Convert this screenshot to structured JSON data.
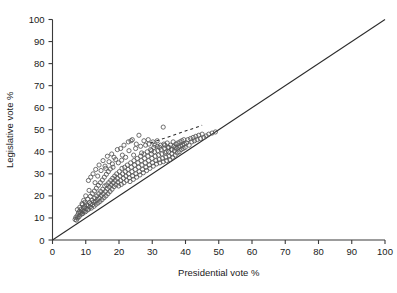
{
  "chart_data": {
    "type": "scatter",
    "title": "",
    "xlabel": "Presidential vote %",
    "ylabel": "Legislative vote %",
    "xlim": [
      0,
      100
    ],
    "ylim": [
      0,
      100
    ],
    "xticks": [
      0,
      10,
      20,
      30,
      40,
      50,
      60,
      70,
      80,
      90,
      100
    ],
    "yticks": [
      0,
      10,
      20,
      30,
      40,
      50,
      60,
      70,
      80,
      90,
      100
    ],
    "xticklabels": [
      "0",
      "10",
      "20",
      "30",
      "40",
      "50",
      "60",
      "70",
      "80",
      "90",
      "100"
    ],
    "yticklabels": [
      "0",
      "10",
      "20",
      "30",
      "40",
      "50",
      "60",
      "70",
      "80",
      "90",
      "100"
    ],
    "grid": false,
    "legend": null,
    "marker": "open-circle",
    "marker_color": "#555555",
    "reference_line": {
      "name": "identity-line",
      "style": "solid",
      "x": [
        0,
        100
      ],
      "y": [
        0,
        100
      ]
    },
    "fit_line": {
      "name": "dashed-trend-line",
      "style": "dashed",
      "x": [
        29.5,
        45.0
      ],
      "y": [
        44.0,
        52.0
      ]
    },
    "points": [
      [
        6.8,
        9.3
      ],
      [
        7.0,
        10.2
      ],
      [
        7.2,
        9.0
      ],
      [
        7.4,
        11.0
      ],
      [
        7.6,
        10.0
      ],
      [
        7.8,
        12.2
      ],
      [
        8.0,
        10.6
      ],
      [
        8.1,
        13.0
      ],
      [
        8.3,
        11.4
      ],
      [
        8.5,
        12.5
      ],
      [
        8.6,
        14.0
      ],
      [
        8.8,
        11.8
      ],
      [
        9.0,
        13.3
      ],
      [
        9.1,
        12.0
      ],
      [
        9.3,
        14.6
      ],
      [
        9.5,
        13.0
      ],
      [
        9.7,
        15.2
      ],
      [
        9.9,
        12.8
      ],
      [
        10.1,
        14.2
      ],
      [
        10.3,
        16.0
      ],
      [
        10.5,
        13.6
      ],
      [
        10.7,
        15.5
      ],
      [
        10.9,
        14.0
      ],
      [
        11.1,
        17.0
      ],
      [
        11.3,
        15.0
      ],
      [
        11.5,
        16.4
      ],
      [
        11.7,
        14.5
      ],
      [
        11.9,
        18.0
      ],
      [
        12.1,
        16.0
      ],
      [
        12.3,
        17.2
      ],
      [
        12.5,
        15.3
      ],
      [
        12.7,
        19.0
      ],
      [
        12.9,
        17.5
      ],
      [
        13.1,
        16.2
      ],
      [
        13.3,
        20.0
      ],
      [
        13.5,
        18.4
      ],
      [
        13.7,
        16.8
      ],
      [
        13.9,
        21.0
      ],
      [
        14.1,
        19.0
      ],
      [
        14.3,
        17.5
      ],
      [
        14.5,
        22.0
      ],
      [
        14.7,
        20.2
      ],
      [
        14.9,
        18.3
      ],
      [
        15.1,
        23.0
      ],
      [
        15.3,
        21.0
      ],
      [
        15.5,
        19.2
      ],
      [
        15.7,
        24.5
      ],
      [
        15.9,
        22.0
      ],
      [
        16.1,
        20.0
      ],
      [
        16.3,
        25.0
      ],
      [
        16.5,
        23.2
      ],
      [
        16.7,
        21.0
      ],
      [
        16.9,
        26.0
      ],
      [
        17.1,
        24.0
      ],
      [
        17.3,
        22.0
      ],
      [
        17.5,
        27.0
      ],
      [
        17.7,
        25.0
      ],
      [
        17.9,
        23.0
      ],
      [
        18.1,
        28.0
      ],
      [
        18.3,
        26.0
      ],
      [
        18.5,
        24.2
      ],
      [
        18.7,
        29.0
      ],
      [
        18.9,
        27.0
      ],
      [
        19.1,
        25.0
      ],
      [
        19.3,
        30.0
      ],
      [
        19.5,
        28.0
      ],
      [
        19.7,
        26.2
      ],
      [
        19.9,
        24.5
      ],
      [
        20.1,
        31.0
      ],
      [
        20.3,
        29.0
      ],
      [
        20.5,
        27.0
      ],
      [
        20.7,
        25.2
      ],
      [
        20.9,
        32.5
      ],
      [
        21.1,
        30.0
      ],
      [
        21.3,
        28.0
      ],
      [
        21.5,
        26.0
      ],
      [
        21.7,
        33.0
      ],
      [
        21.9,
        31.0
      ],
      [
        22.1,
        29.0
      ],
      [
        22.3,
        27.0
      ],
      [
        22.5,
        34.0
      ],
      [
        22.7,
        32.0
      ],
      [
        22.9,
        30.0
      ],
      [
        23.1,
        28.2
      ],
      [
        23.3,
        26.5
      ],
      [
        23.5,
        35.0
      ],
      [
        23.7,
        33.0
      ],
      [
        23.9,
        31.0
      ],
      [
        24.1,
        29.0
      ],
      [
        24.3,
        27.5
      ],
      [
        24.5,
        36.0
      ],
      [
        24.7,
        34.0
      ],
      [
        24.9,
        32.0
      ],
      [
        25.1,
        30.0
      ],
      [
        25.3,
        28.5
      ],
      [
        25.5,
        37.0
      ],
      [
        25.7,
        35.0
      ],
      [
        25.9,
        33.0
      ],
      [
        26.1,
        31.0
      ],
      [
        26.3,
        29.5
      ],
      [
        26.5,
        38.0
      ],
      [
        26.7,
        36.0
      ],
      [
        26.9,
        34.0
      ],
      [
        27.1,
        32.0
      ],
      [
        27.3,
        30.5
      ],
      [
        27.5,
        39.0
      ],
      [
        27.7,
        37.0
      ],
      [
        27.9,
        35.0
      ],
      [
        28.1,
        33.0
      ],
      [
        28.3,
        31.5
      ],
      [
        28.5,
        40.0
      ],
      [
        28.7,
        38.0
      ],
      [
        28.9,
        36.0
      ],
      [
        29.1,
        34.0
      ],
      [
        29.3,
        32.5
      ],
      [
        29.5,
        41.0
      ],
      [
        29.7,
        39.0
      ],
      [
        29.9,
        37.0
      ],
      [
        30.1,
        35.0
      ],
      [
        30.3,
        33.5
      ],
      [
        30.5,
        42.0
      ],
      [
        30.7,
        40.0
      ],
      [
        30.9,
        38.0
      ],
      [
        31.1,
        36.0
      ],
      [
        31.3,
        34.5
      ],
      [
        31.5,
        42.5
      ],
      [
        31.7,
        40.5
      ],
      [
        31.9,
        38.5
      ],
      [
        32.1,
        36.5
      ],
      [
        32.3,
        35.0
      ],
      [
        32.5,
        43.0
      ],
      [
        32.7,
        41.0
      ],
      [
        32.9,
        39.0
      ],
      [
        33.1,
        37.0
      ],
      [
        33.3,
        35.5
      ],
      [
        33.5,
        43.5
      ],
      [
        33.7,
        41.5
      ],
      [
        33.9,
        39.5
      ],
      [
        34.1,
        37.5
      ],
      [
        34.3,
        36.0
      ],
      [
        34.5,
        44.0
      ],
      [
        34.7,
        42.0
      ],
      [
        34.9,
        40.0
      ],
      [
        35.1,
        38.0
      ],
      [
        35.3,
        36.5
      ],
      [
        35.5,
        43.0
      ],
      [
        35.7,
        41.0
      ],
      [
        35.9,
        39.0
      ],
      [
        36.1,
        37.5
      ],
      [
        36.3,
        44.5
      ],
      [
        36.5,
        42.5
      ],
      [
        36.7,
        40.5
      ],
      [
        36.9,
        38.5
      ],
      [
        37.1,
        43.5
      ],
      [
        37.3,
        41.5
      ],
      [
        37.5,
        39.5
      ],
      [
        37.7,
        44.0
      ],
      [
        37.9,
        42.0
      ],
      [
        38.1,
        40.0
      ],
      [
        38.3,
        44.5
      ],
      [
        38.5,
        42.5
      ],
      [
        38.7,
        41.0
      ],
      [
        38.9,
        45.0
      ],
      [
        39.1,
        43.0
      ],
      [
        39.3,
        41.5
      ],
      [
        39.5,
        45.5
      ],
      [
        39.7,
        43.5
      ],
      [
        39.9,
        42.0
      ],
      [
        40.3,
        44.0
      ],
      [
        40.7,
        45.5
      ],
      [
        41.1,
        43.0
      ],
      [
        41.5,
        46.0
      ],
      [
        41.9,
        44.5
      ],
      [
        42.3,
        46.5
      ],
      [
        42.7,
        45.0
      ],
      [
        43.1,
        47.0
      ],
      [
        43.5,
        45.5
      ],
      [
        44.0,
        47.5
      ],
      [
        44.5,
        46.0
      ],
      [
        45.0,
        48.0
      ],
      [
        45.5,
        46.5
      ],
      [
        46.2,
        47.2
      ],
      [
        47.0,
        48.0
      ],
      [
        48.0,
        48.5
      ],
      [
        49.0,
        49.0
      ],
      [
        33.3,
        51.2
      ],
      [
        26.0,
        47.5
      ],
      [
        24.0,
        45.5
      ],
      [
        21.5,
        43.0
      ],
      [
        19.5,
        41.0
      ],
      [
        17.8,
        39.0
      ],
      [
        16.5,
        38.0
      ],
      [
        15.2,
        36.0
      ],
      [
        14.0,
        34.0
      ],
      [
        13.0,
        32.0
      ],
      [
        12.2,
        30.0
      ],
      [
        11.5,
        28.5
      ],
      [
        10.8,
        27.0
      ],
      [
        22.8,
        44.5
      ],
      [
        23.6,
        45.0
      ],
      [
        25.2,
        43.5
      ],
      [
        27.5,
        45.0
      ],
      [
        28.8,
        45.5
      ],
      [
        30.2,
        44.5
      ],
      [
        31.5,
        45.0
      ],
      [
        20.5,
        41.5
      ],
      [
        18.5,
        37.5
      ],
      [
        17.0,
        35.5
      ],
      [
        15.8,
        33.5
      ],
      [
        14.6,
        31.5
      ],
      [
        12.8,
        26.0
      ],
      [
        11.0,
        22.5
      ],
      [
        10.0,
        20.0
      ],
      [
        9.4,
        18.0
      ],
      [
        8.9,
        16.5
      ],
      [
        13.6,
        29.0
      ],
      [
        16.0,
        32.5
      ],
      [
        18.0,
        34.5
      ],
      [
        19.0,
        36.5
      ],
      [
        21.0,
        38.5
      ],
      [
        23.0,
        40.5
      ],
      [
        25.0,
        41.5
      ],
      [
        26.5,
        42.5
      ],
      [
        28.0,
        43.0
      ],
      [
        29.0,
        43.5
      ],
      [
        30.8,
        43.0
      ],
      [
        32.2,
        42.0
      ],
      [
        33.8,
        43.0
      ],
      [
        35.0,
        42.0
      ],
      [
        36.0,
        41.0
      ],
      [
        7.5,
        13.8
      ],
      [
        8.2,
        14.8
      ],
      [
        9.0,
        16.0
      ],
      [
        9.8,
        17.2
      ],
      [
        10.6,
        18.5
      ],
      [
        11.4,
        19.8
      ],
      [
        12.0,
        21.0
      ],
      [
        12.6,
        22.2
      ],
      [
        13.2,
        23.5
      ],
      [
        13.8,
        24.8
      ],
      [
        14.4,
        26.0
      ],
      [
        15.0,
        27.2
      ],
      [
        15.6,
        28.5
      ],
      [
        16.2,
        29.8
      ],
      [
        16.8,
        31.0
      ],
      [
        17.4,
        32.2
      ],
      [
        18.2,
        33.0
      ],
      [
        19.8,
        35.0
      ],
      [
        20.8,
        36.2
      ],
      [
        22.0,
        37.5
      ],
      [
        24.4,
        38.5
      ],
      [
        26.8,
        39.5
      ],
      [
        29.8,
        40.5
      ],
      [
        34.2,
        40.0
      ],
      [
        37.0,
        42.0
      ]
    ]
  }
}
